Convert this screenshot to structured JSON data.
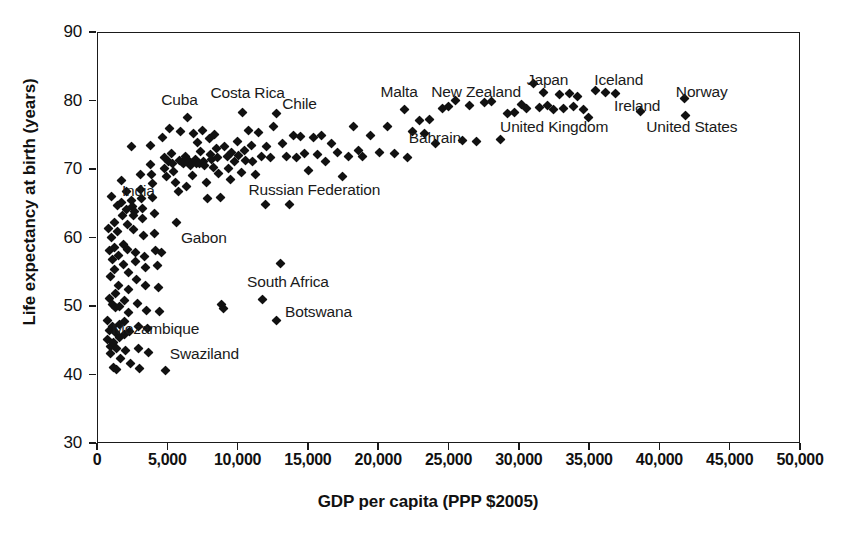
{
  "chart_data": {
    "type": "scatter",
    "title": "",
    "xlabel": "GDP per capita (PPP $2005)",
    "ylabel": "Life expectancy at birth (years)",
    "xlim": [
      0,
      50000
    ],
    "ylim": [
      30,
      90
    ],
    "xticks": [
      0,
      5000,
      10000,
      15000,
      20000,
      25000,
      30000,
      35000,
      40000,
      45000,
      50000
    ],
    "xticklabels": [
      "0",
      "5,000",
      "10,000",
      "15,000",
      "20,000",
      "25,000",
      "30,000",
      "35,000",
      "40,000",
      "45,000",
      "50,000"
    ],
    "yticks": [
      30,
      40,
      50,
      60,
      70,
      80,
      90
    ],
    "yticklabels": [
      "30",
      "40",
      "50",
      "60",
      "70",
      "80",
      "90"
    ],
    "grid": false,
    "legend": false,
    "marker": "diamond",
    "marker_color": "#111111",
    "series_name": "Countries",
    "annotations": [
      {
        "label": "Cuba",
        "x": 6400,
        "y": 77.6,
        "lx": 4500,
        "ly": 80.2
      },
      {
        "label": "Costa Rica",
        "x": 10300,
        "y": 78.4,
        "lx": 8000,
        "ly": 81.2
      },
      {
        "label": "Chile",
        "x": 12700,
        "y": 78.3,
        "lx": 13100,
        "ly": 79.6
      },
      {
        "label": "Malta",
        "x": 21800,
        "y": 78.9,
        "lx": 20100,
        "ly": 81.4
      },
      {
        "label": "New Zealand",
        "x": 25400,
        "y": 80.2,
        "lx": 23700,
        "ly": 81.4
      },
      {
        "label": "Japan",
        "x": 31000,
        "y": 82.7,
        "lx": 30500,
        "ly": 83.1
      },
      {
        "label": "Iceland",
        "x": 35400,
        "y": 81.6,
        "lx": 35300,
        "ly": 83.1
      },
      {
        "label": "Ireland",
        "x": 38600,
        "y": 78.6,
        "lx": 36700,
        "ly": 79.4
      },
      {
        "label": "Norway",
        "x": 41700,
        "y": 80.4,
        "lx": 41100,
        "ly": 81.4
      },
      {
        "label": "United States",
        "x": 41800,
        "y": 77.9,
        "lx": 39000,
        "ly": 76.3
      },
      {
        "label": "United Kingdom",
        "x": 32000,
        "y": 79.4,
        "lx": 28600,
        "ly": 76.3
      },
      {
        "label": "Bahrain",
        "x": 22400,
        "y": 75.6,
        "lx": 22100,
        "ly": 74.6
      },
      {
        "label": "India",
        "x": 2600,
        "y": 64.1,
        "lx": 1700,
        "ly": 67.0
      },
      {
        "label": "Russian Federation",
        "x": 13600,
        "y": 64.9,
        "lx": 10700,
        "ly": 67.1
      },
      {
        "label": "Gabon",
        "x": 13000,
        "y": 56.3,
        "lx": 5900,
        "ly": 60.1
      },
      {
        "label": "South Africa",
        "x": 11700,
        "y": 51.1,
        "lx": 10600,
        "ly": 53.6
      },
      {
        "label": "Botswana",
        "x": 12700,
        "y": 48.1,
        "lx": 13300,
        "ly": 49.2
      },
      {
        "label": "Mozambique",
        "x": 800,
        "y": 47.0,
        "lx": 1000,
        "ly": 46.8
      },
      {
        "label": "Swaziland",
        "x": 4800,
        "y": 40.8,
        "lx": 5100,
        "ly": 43.2
      }
    ],
    "points": [
      [
        700,
        48.0
      ],
      [
        700,
        45.2
      ],
      [
        750,
        61.4
      ],
      [
        800,
        58.3
      ],
      [
        820,
        51.2
      ],
      [
        850,
        46.6
      ],
      [
        880,
        44.2
      ],
      [
        900,
        54.4
      ],
      [
        920,
        43.2
      ],
      [
        950,
        66.1
      ],
      [
        980,
        60.1
      ],
      [
        1000,
        57.0
      ],
      [
        1020,
        50.4
      ],
      [
        1050,
        47.1
      ],
      [
        1080,
        44.8
      ],
      [
        1100,
        41.2
      ],
      [
        1150,
        62.4
      ],
      [
        1180,
        58.7
      ],
      [
        1200,
        55.5
      ],
      [
        1220,
        52.0
      ],
      [
        1250,
        49.9
      ],
      [
        1280,
        46.3
      ],
      [
        1300,
        43.9
      ],
      [
        1350,
        40.9
      ],
      [
        1400,
        64.8
      ],
      [
        1420,
        61.0
      ],
      [
        1450,
        57.5
      ],
      [
        1480,
        53.2
      ],
      [
        1500,
        50.1
      ],
      [
        1530,
        47.4
      ],
      [
        1560,
        45.6
      ],
      [
        1600,
        42.5
      ],
      [
        1650,
        65.3
      ],
      [
        1700,
        68.5
      ],
      [
        1750,
        63.4
      ],
      [
        1780,
        59.1
      ],
      [
        1800,
        56.2
      ],
      [
        1850,
        51.0
      ],
      [
        1880,
        47.9
      ],
      [
        1900,
        46.0
      ],
      [
        1950,
        43.6
      ],
      [
        2000,
        66.9
      ],
      [
        2050,
        64.2
      ],
      [
        2080,
        62.0
      ],
      [
        2100,
        58.4
      ],
      [
        2150,
        55.0
      ],
      [
        2180,
        52.6
      ],
      [
        2200,
        49.2
      ],
      [
        2250,
        46.4
      ],
      [
        2300,
        41.8
      ],
      [
        2350,
        73.5
      ],
      [
        2400,
        65.5
      ],
      [
        2450,
        64.6
      ],
      [
        2500,
        63.3
      ],
      [
        2550,
        61.3
      ],
      [
        2600,
        64.0
      ],
      [
        2650,
        58.0
      ],
      [
        2700,
        56.6
      ],
      [
        2750,
        54.0
      ],
      [
        2800,
        50.5
      ],
      [
        2850,
        47.2
      ],
      [
        2900,
        44.0
      ],
      [
        2950,
        41.0
      ],
      [
        3000,
        69.4
      ],
      [
        3050,
        67.2
      ],
      [
        3100,
        65.8
      ],
      [
        3150,
        64.4
      ],
      [
        3200,
        62.9
      ],
      [
        3250,
        60.4
      ],
      [
        3300,
        57.3
      ],
      [
        3350,
        55.8
      ],
      [
        3400,
        53.1
      ],
      [
        3450,
        49.5
      ],
      [
        3500,
        46.8
      ],
      [
        3600,
        43.4
      ],
      [
        3700,
        73.6
      ],
      [
        3750,
        70.8
      ],
      [
        3800,
        69.3
      ],
      [
        3850,
        68.0
      ],
      [
        3900,
        66.0
      ],
      [
        4000,
        63.6
      ],
      [
        4050,
        60.8
      ],
      [
        4100,
        58.2
      ],
      [
        4200,
        56.0
      ],
      [
        4300,
        52.9
      ],
      [
        4400,
        49.4
      ],
      [
        4500,
        57.9
      ],
      [
        4600,
        74.8
      ],
      [
        4700,
        71.8
      ],
      [
        4750,
        70.2
      ],
      [
        4800,
        40.8
      ],
      [
        4900,
        69.0
      ],
      [
        5000,
        71.2
      ],
      [
        5100,
        76.0
      ],
      [
        5200,
        72.4
      ],
      [
        5300,
        71.0
      ],
      [
        5400,
        69.8
      ],
      [
        5500,
        68.2
      ],
      [
        5600,
        62.4
      ],
      [
        5700,
        66.9
      ],
      [
        5800,
        71.4
      ],
      [
        5900,
        75.6
      ],
      [
        6000,
        71.1
      ],
      [
        6100,
        70.9
      ],
      [
        6200,
        72.0
      ],
      [
        6300,
        67.6
      ],
      [
        6400,
        77.6
      ],
      [
        6500,
        71.3
      ],
      [
        6600,
        70.7
      ],
      [
        6700,
        69.2
      ],
      [
        6800,
        75.3
      ],
      [
        6900,
        71.6
      ],
      [
        7000,
        70.9
      ],
      [
        7100,
        74.0
      ],
      [
        7200,
        71.0
      ],
      [
        7300,
        72.7
      ],
      [
        7400,
        75.8
      ],
      [
        7500,
        71.2
      ],
      [
        7600,
        70.6
      ],
      [
        7700,
        68.2
      ],
      [
        7800,
        65.8
      ],
      [
        7900,
        74.6
      ],
      [
        8000,
        72.2
      ],
      [
        8100,
        71.5
      ],
      [
        8200,
        70.4
      ],
      [
        8300,
        75.2
      ],
      [
        8400,
        73.1
      ],
      [
        8500,
        71.8
      ],
      [
        8600,
        69.5
      ],
      [
        8700,
        66.0
      ],
      [
        8800,
        50.3
      ],
      [
        8900,
        49.8
      ],
      [
        9000,
        73.4
      ],
      [
        9200,
        71.9
      ],
      [
        9300,
        70.2
      ],
      [
        9400,
        68.6
      ],
      [
        9500,
        72.6
      ],
      [
        9700,
        71.2
      ],
      [
        9900,
        74.2
      ],
      [
        10000,
        72.1
      ],
      [
        10200,
        69.6
      ],
      [
        10300,
        78.4
      ],
      [
        10400,
        72.8
      ],
      [
        10500,
        71.4
      ],
      [
        10700,
        75.8
      ],
      [
        10900,
        73.6
      ],
      [
        11000,
        71.2
      ],
      [
        11200,
        69.3
      ],
      [
        11400,
        75.5
      ],
      [
        11600,
        72.0
      ],
      [
        11700,
        51.1
      ],
      [
        11900,
        64.9
      ],
      [
        12000,
        73.4
      ],
      [
        12300,
        71.8
      ],
      [
        12500,
        76.4
      ],
      [
        12700,
        78.3
      ],
      [
        12700,
        48.1
      ],
      [
        13000,
        56.3
      ],
      [
        13100,
        73.8
      ],
      [
        13400,
        72.0
      ],
      [
        13600,
        64.9
      ],
      [
        13900,
        75.0
      ],
      [
        14100,
        71.8
      ],
      [
        14400,
        74.9
      ],
      [
        14700,
        72.4
      ],
      [
        15000,
        69.9
      ],
      [
        15300,
        74.7
      ],
      [
        15600,
        72.2
      ],
      [
        15900,
        75.0
      ],
      [
        16200,
        71.3
      ],
      [
        16600,
        73.8
      ],
      [
        17000,
        72.5
      ],
      [
        17400,
        69.1
      ],
      [
        17800,
        71.9
      ],
      [
        18200,
        76.4
      ],
      [
        18500,
        72.8
      ],
      [
        18800,
        71.9
      ],
      [
        19400,
        75.1
      ],
      [
        20000,
        72.5
      ],
      [
        20600,
        76.3
      ],
      [
        21100,
        72.4
      ],
      [
        21800,
        78.9
      ],
      [
        22000,
        71.8
      ],
      [
        22400,
        75.6
      ],
      [
        22900,
        77.2
      ],
      [
        23200,
        75.3
      ],
      [
        23600,
        77.4
      ],
      [
        24000,
        73.9
      ],
      [
        24500,
        79.0
      ],
      [
        24900,
        79.2
      ],
      [
        25400,
        80.2
      ],
      [
        25900,
        74.3
      ],
      [
        26400,
        79.4
      ],
      [
        26900,
        74.1
      ],
      [
        27500,
        79.9
      ],
      [
        28000,
        80.0
      ],
      [
        28600,
        74.5
      ],
      [
        29100,
        78.2
      ],
      [
        29600,
        78.4
      ],
      [
        30100,
        79.6
      ],
      [
        30500,
        79.0
      ],
      [
        31000,
        82.7
      ],
      [
        31400,
        79.1
      ],
      [
        31700,
        81.3
      ],
      [
        32000,
        79.4
      ],
      [
        32400,
        78.9
      ],
      [
        32800,
        81.0
      ],
      [
        33100,
        79.0
      ],
      [
        33500,
        81.2
      ],
      [
        33800,
        79.2
      ],
      [
        34100,
        80.8
      ],
      [
        34500,
        78.9
      ],
      [
        34900,
        77.6
      ],
      [
        35400,
        81.6
      ],
      [
        36100,
        81.3
      ],
      [
        36800,
        81.2
      ],
      [
        38600,
        78.6
      ],
      [
        41700,
        80.4
      ],
      [
        41800,
        77.9
      ]
    ]
  },
  "caption": {
    "partial_text": ""
  }
}
